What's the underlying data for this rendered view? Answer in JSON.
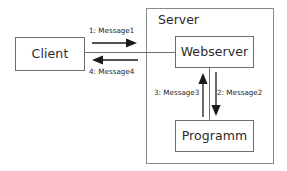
{
  "diagram": {
    "type": "communication-diagram",
    "nodes": [
      {
        "id": "client",
        "label": "Client"
      },
      {
        "id": "webserver",
        "label": "Webserver"
      },
      {
        "id": "programm",
        "label": "Programm"
      }
    ],
    "containers": [
      {
        "id": "server",
        "label": "Server"
      }
    ],
    "messages": [
      {
        "seq": "1",
        "name": "Message1",
        "label": "1: Message1",
        "from": "client",
        "to": "webserver",
        "direction": "right"
      },
      {
        "seq": "2",
        "name": "Message2",
        "label": "2: Message2",
        "from": "webserver",
        "to": "programm",
        "direction": "down"
      },
      {
        "seq": "3",
        "name": "Message3",
        "label": "3: Message3",
        "from": "programm",
        "to": "webserver",
        "direction": "up"
      },
      {
        "seq": "4",
        "name": "Message4",
        "label": "4: Message4",
        "from": "webserver",
        "to": "client",
        "direction": "left"
      }
    ]
  },
  "colors": {
    "background": "#ffffff",
    "node_border": "#6d6d6d",
    "container_border": "#8a8a8a",
    "text": "#2b2b2b",
    "arrow": "#1a1a1a"
  }
}
